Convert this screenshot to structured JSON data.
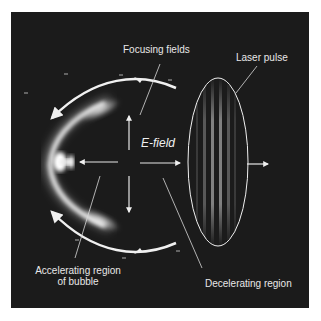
{
  "diagram": {
    "labels": {
      "focusing_fields": "Focusing fields",
      "laser_pulse": "Laser pulse",
      "e_field": "E-field",
      "accelerating_line1": "Accelerating region",
      "accelerating_line2": "of bubble",
      "decelerating": "Decelerating region"
    },
    "charge_sign": "-",
    "colors": {
      "background": "#1b1b1b",
      "foreground": "#f0f0f0",
      "page": "#ffffff"
    }
  }
}
